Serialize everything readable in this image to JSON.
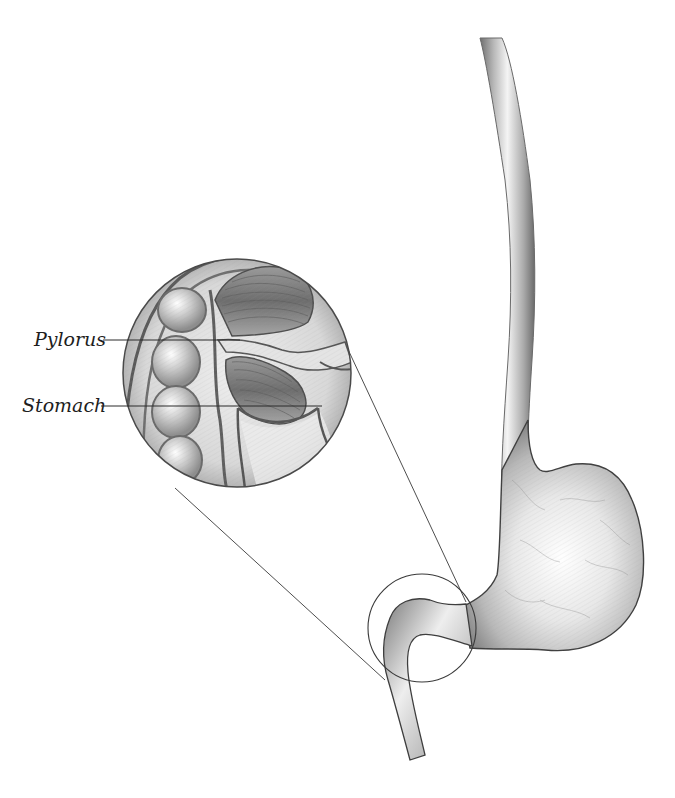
{
  "figure": {
    "title_fragment": "",
    "labels": [
      {
        "id": "pylorus",
        "text": "Pylorus"
      },
      {
        "id": "stomach",
        "text": "Stomach"
      }
    ],
    "colors": {
      "background": "#ffffff",
      "outline": "#3a3a3a",
      "tissue_light": "#f2f2f2",
      "tissue_mid": "#c4c4c4",
      "tissue_dark": "#7c7c7c",
      "leader_line": "#2a2a2a"
    }
  }
}
